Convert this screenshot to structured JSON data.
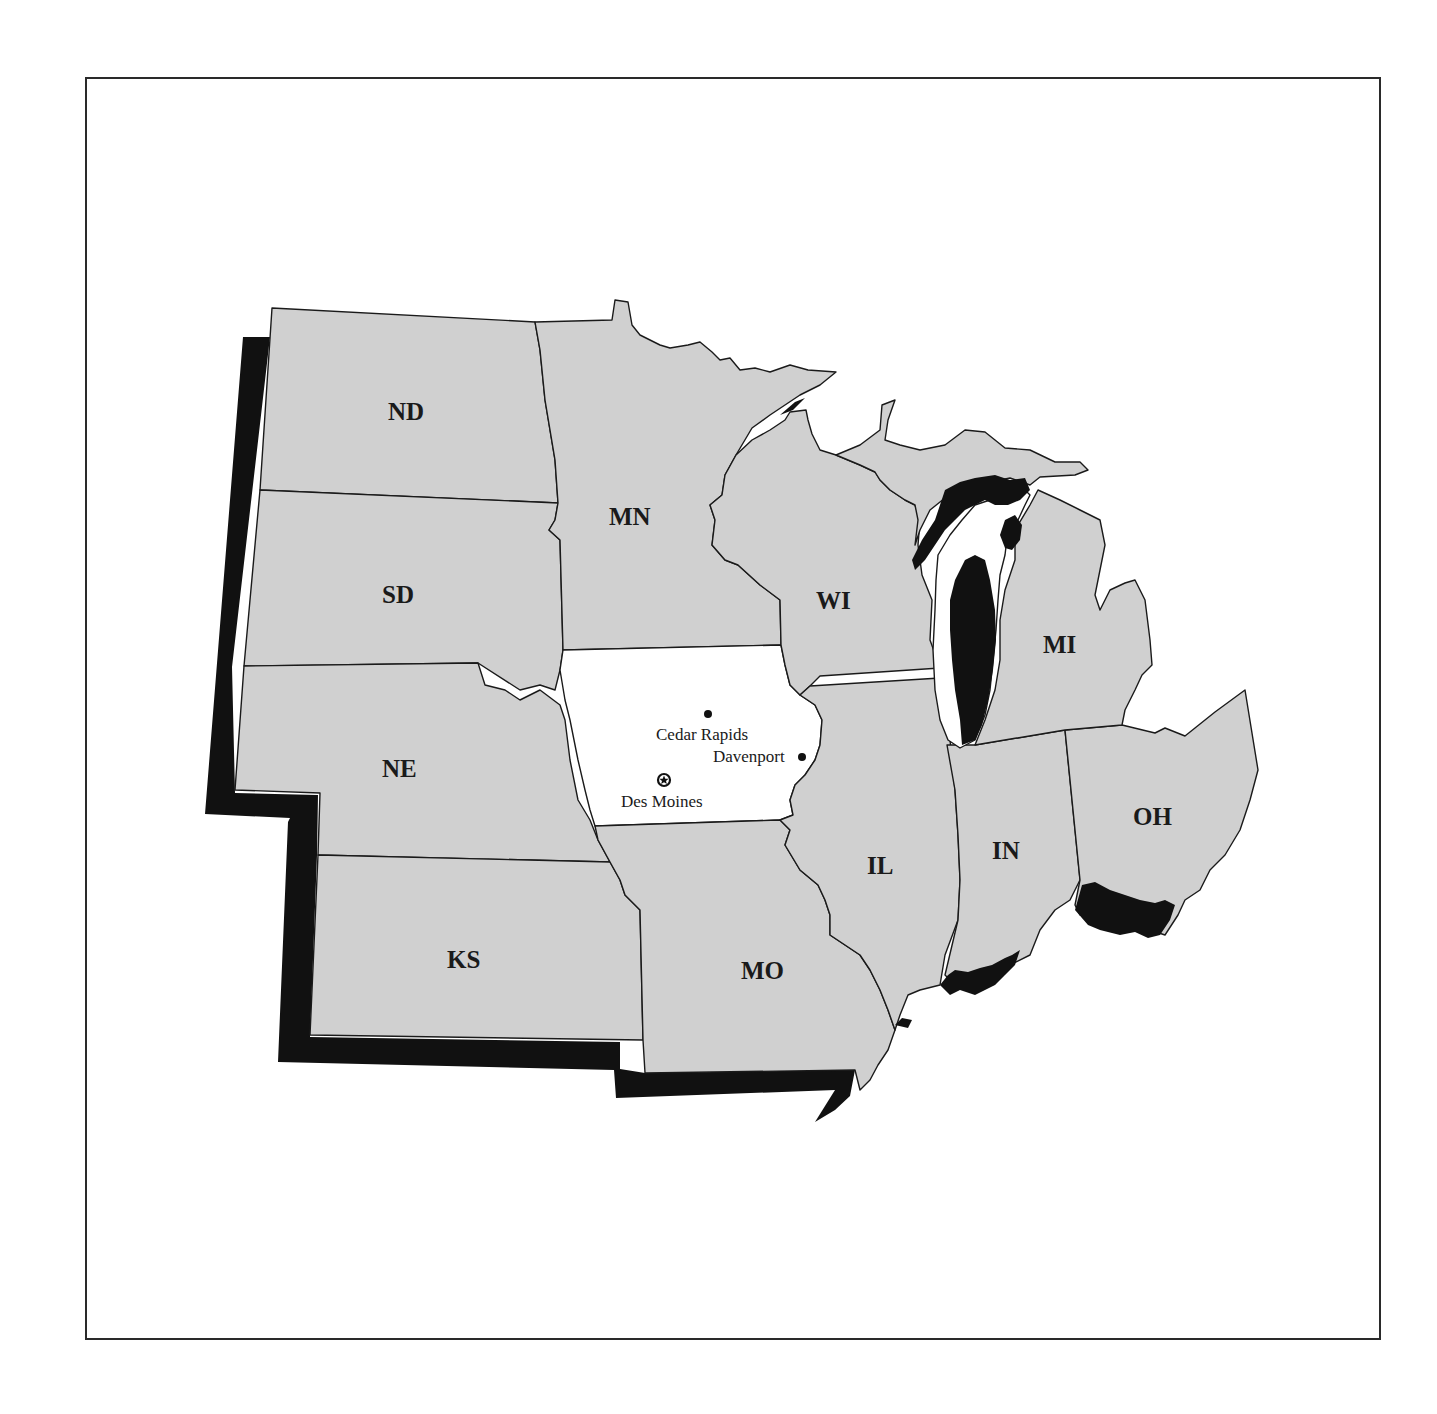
{
  "map": {
    "title": "",
    "colors": {
      "state_fill": "#d0d0d0",
      "highlight_fill": "#ffffff",
      "shadow": "#111111",
      "border": "#1a1a1a"
    },
    "highlighted_state": "IA",
    "states": [
      {
        "abbr": "ND",
        "label": "ND"
      },
      {
        "abbr": "SD",
        "label": "SD"
      },
      {
        "abbr": "NE",
        "label": "NE"
      },
      {
        "abbr": "KS",
        "label": "KS"
      },
      {
        "abbr": "MN",
        "label": "MN"
      },
      {
        "abbr": "IA",
        "label": ""
      },
      {
        "abbr": "MO",
        "label": "MO"
      },
      {
        "abbr": "WI",
        "label": "WI"
      },
      {
        "abbr": "IL",
        "label": "IL"
      },
      {
        "abbr": "MI",
        "label": "MI"
      },
      {
        "abbr": "IN",
        "label": "IN"
      },
      {
        "abbr": "OH",
        "label": "OH"
      }
    ],
    "cities": [
      {
        "name": "Cedar Rapids",
        "marker": "dot"
      },
      {
        "name": "Davenport",
        "marker": "dot"
      },
      {
        "name": "Des Moines",
        "marker": "star-capital"
      }
    ]
  }
}
